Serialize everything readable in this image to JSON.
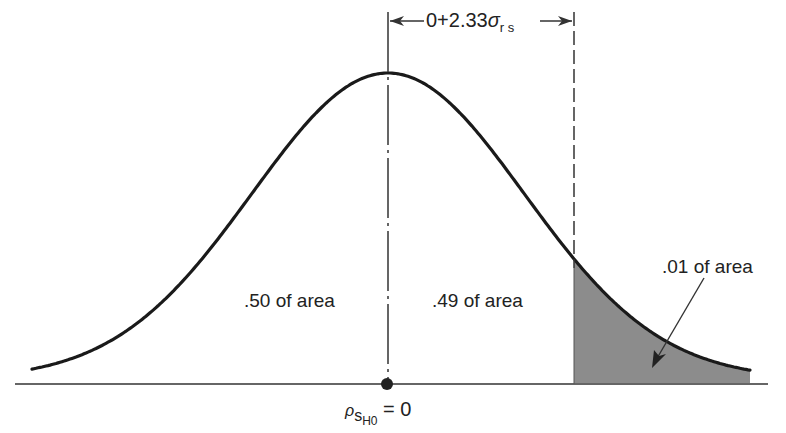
{
  "figure": {
    "type": "normal-distribution-diagram",
    "colors": {
      "curve": "#1a1a1a",
      "shade": "#8c8c8c",
      "axis": "#333333",
      "background": "#ffffff"
    },
    "curve": {
      "center_px": 388,
      "peak_y_px": 73,
      "baseline_y_px": 383,
      "sigma_px": 136,
      "x_start_px": 32,
      "x_end_px": 750
    },
    "dimension": {
      "label_prefix": "0+2.33",
      "sigma_symbol": "σ",
      "sigma_subscript": "r s"
    },
    "regions": [
      {
        "label": ".50 of area",
        "share": 0.5
      },
      {
        "label": ".49 of area",
        "share": 0.49
      },
      {
        "label": ".01 of area",
        "share": 0.01,
        "shaded": true
      }
    ],
    "mean_label": {
      "rho": "ρ",
      "sub_s": "s",
      "sub_h0": "H0",
      "equals": "= 0"
    },
    "critical_z": 2.33
  }
}
